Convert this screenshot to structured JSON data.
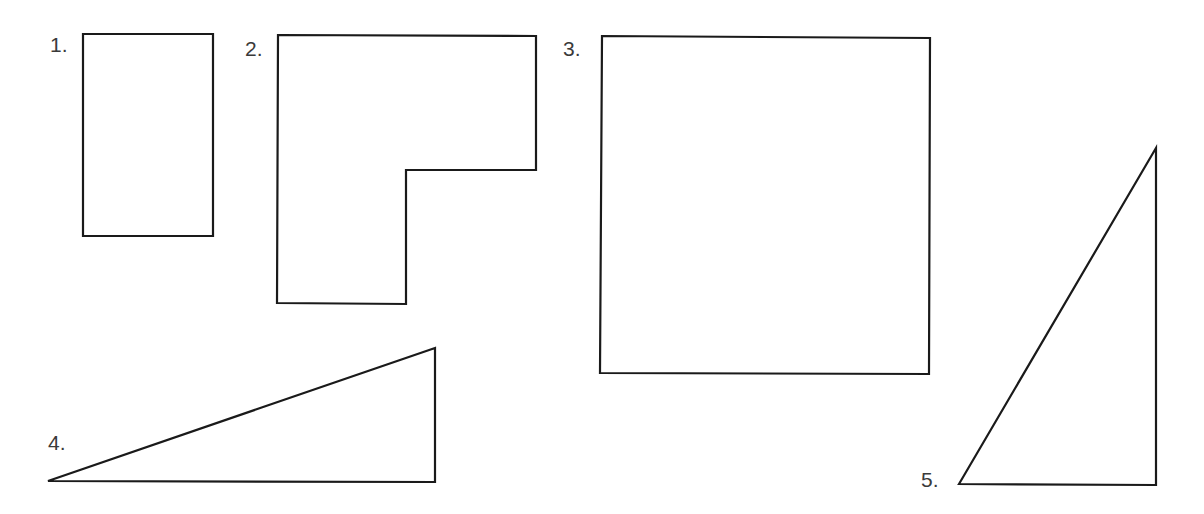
{
  "figure": {
    "background": "#ffffff",
    "stroke_color": "#1a1a1a",
    "label_color": "#3a3a3a",
    "shapes": [
      {
        "label": "1.",
        "type": "rectangle",
        "points": [
          [
            83,
            34
          ],
          [
            213,
            34
          ],
          [
            213,
            236
          ],
          [
            83,
            236
          ]
        ]
      },
      {
        "label": "2.",
        "type": "L-shape",
        "points": [
          [
            278,
            35
          ],
          [
            536,
            36
          ],
          [
            536,
            170
          ],
          [
            406,
            170
          ],
          [
            406,
            304
          ],
          [
            277,
            303
          ]
        ]
      },
      {
        "label": "3.",
        "type": "square",
        "points": [
          [
            602,
            36
          ],
          [
            930,
            38
          ],
          [
            929,
            374
          ],
          [
            600,
            373
          ]
        ]
      },
      {
        "label": "4.",
        "type": "right-triangle",
        "points": [
          [
            48,
            481
          ],
          [
            435,
            348
          ],
          [
            435,
            482
          ]
        ]
      },
      {
        "label": "5.",
        "type": "right-triangle",
        "points": [
          [
            959,
            484
          ],
          [
            1156,
            148
          ],
          [
            1156,
            485
          ]
        ]
      }
    ]
  }
}
